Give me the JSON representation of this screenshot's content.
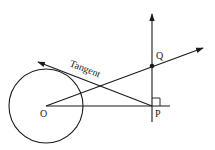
{
  "diagram": {
    "labels": {
      "center": "O",
      "point_q": "Q",
      "point_p": "P",
      "tangent": "Tangent"
    },
    "colors": {
      "stroke": "#1a1a1a",
      "background": "#ffffff"
    }
  }
}
